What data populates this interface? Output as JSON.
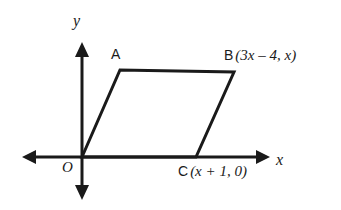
{
  "figure": {
    "background_color": "#ffffff",
    "stroke_color": "#1a1a1a"
  },
  "axes": {
    "x_axis_label": "x",
    "y_axis_label": "y",
    "origin_label": "O",
    "x_axis": {
      "y": 157,
      "x_start": 22,
      "x_end": 270,
      "arrows": "both"
    },
    "y_axis": {
      "x": 82,
      "y_start": 42,
      "y_end": 200,
      "arrows": "both"
    }
  },
  "shape": {
    "name": "parallelogram",
    "vertices": [
      {
        "label": "O",
        "x": 82,
        "y": 157
      },
      {
        "label": "A",
        "x": 120,
        "y": 70
      },
      {
        "label": "B",
        "x": 234,
        "y": 72
      },
      {
        "label": "C",
        "x": 196,
        "y": 157
      }
    ]
  },
  "labels": {
    "A": {
      "point": "A",
      "coords": ""
    },
    "B": {
      "point": "B",
      "coords": "(3x – 4, x)"
    },
    "C": {
      "point": "C",
      "coords": "(x + 1, 0)"
    },
    "O": "O",
    "x": "x",
    "y": "y"
  }
}
